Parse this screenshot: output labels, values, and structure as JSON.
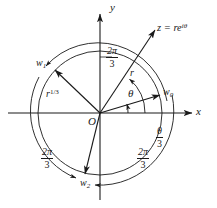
{
  "figure": {
    "type": "complex-plane-cube-roots-diagram",
    "axes": {
      "x_label": "x",
      "y_label": "y",
      "origin_label": "O"
    },
    "vectors": {
      "z": {
        "label": "z = re",
        "exponent": "iθ",
        "magnitude_label": "r",
        "angle_label": "θ"
      },
      "w0": {
        "label": "w",
        "subscript": "0"
      },
      "w1": {
        "label": "w",
        "subscript": "1"
      },
      "w2": {
        "label": "w",
        "subscript": "2"
      },
      "radius_label": "r",
      "radius_exponent": "1/3"
    },
    "angles": {
      "theta_over_three": {
        "numerator": "θ",
        "denominator": "3"
      },
      "two_pi_over_three_top": {
        "numerator": "2π",
        "denominator": "3"
      },
      "two_pi_over_three_left": {
        "numerator": "2π",
        "denominator": "3"
      },
      "two_pi_over_three_right": {
        "numerator": "2π",
        "denominator": "3"
      }
    },
    "colors": {
      "stroke": "#1a1a1a",
      "background": "#ffffff"
    }
  }
}
